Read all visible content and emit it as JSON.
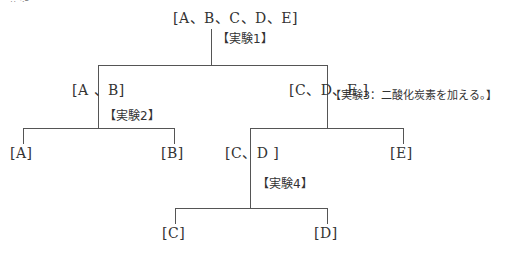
{
  "header": {
    "partial_text": "（手順）"
  },
  "nodes": {
    "root": "[A、B、C、D、E]",
    "ab": "[A 、B]",
    "cde": "[C、D、E ]",
    "a": "[A]",
    "b": "[B]",
    "cd": "[C、D ]",
    "e": "[E]",
    "c": "[C]",
    "d": "[D]"
  },
  "experiments": {
    "exp1": "【実験1】",
    "exp2": "【実験2】",
    "exp3": "【実験3：二酸化炭素を加える。】",
    "exp4": "【実験4】"
  },
  "colors": {
    "line": "#555555",
    "text": "#333333",
    "background": "#ffffff"
  }
}
